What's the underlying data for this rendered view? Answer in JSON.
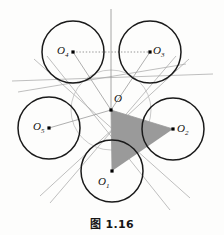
{
  "figure": {
    "caption": "图 1.16",
    "center_label": "O",
    "colors": {
      "circle_stroke": "#1a1a1a",
      "thin_line": "#9b9b9b",
      "inner_circle": "#b4b4b4",
      "triangle_fill": "#9a9a9a",
      "dot": "#000000",
      "background": "#fdfdfc",
      "text": "#111111"
    },
    "center": {
      "name": "O",
      "x": 111,
      "y": 110
    },
    "inner_circle": {
      "cx": 111,
      "cy": 110,
      "r": 40
    },
    "circles": [
      {
        "name": "O1",
        "label": "O",
        "sub": "1",
        "cx": 112,
        "cy": 171,
        "r": 31,
        "label_x": 102,
        "label_y": 178
      },
      {
        "name": "O2",
        "label": "O",
        "sub": "2",
        "cx": 173,
        "cy": 129,
        "r": 31,
        "label_x": 180,
        "label_y": 124
      },
      {
        "name": "O3",
        "label": "O",
        "sub": "3",
        "cx": 150,
        "cy": 52,
        "r": 31,
        "label_x": 155,
        "label_y": 47
      },
      {
        "name": "O4",
        "label": "O",
        "sub": "4",
        "cx": 73,
        "cy": 52,
        "r": 31,
        "label_x": 55,
        "label_y": 47
      },
      {
        "name": "O5",
        "label": "O",
        "sub": "5",
        "cx": 49,
        "cy": 128,
        "r": 31,
        "label_x": 32,
        "label_y": 124
      }
    ],
    "triangle": {
      "name": "shaded-triangle",
      "vertices": "O, O2, O1",
      "points": "111,110 173,129 112,171"
    },
    "radii_segments": [
      {
        "from": "O",
        "to": "O1"
      },
      {
        "from": "O",
        "to": "O2"
      },
      {
        "from": "O",
        "to": "O3"
      },
      {
        "from": "O",
        "to": "O4"
      },
      {
        "from": "O",
        "to": "O5"
      }
    ],
    "dotted_line": {
      "from": "O4",
      "to": "O3"
    },
    "vertical_axis": {
      "x": 111,
      "y_top": 10,
      "y_bottom": 110
    },
    "tangent_lines": [
      {
        "x1": 9,
        "y1": 80,
        "x2": 214,
        "y2": 75
      },
      {
        "x1": 31,
        "y1": 62,
        "x2": 194,
        "y2": 196
      },
      {
        "x1": 191,
        "y1": 62,
        "x2": 44,
        "y2": 196
      },
      {
        "x1": 9,
        "y1": 85,
        "x2": 180,
        "y2": 82
      },
      {
        "x1": 44,
        "y1": 58,
        "x2": 173,
        "y2": 208
      },
      {
        "x1": 178,
        "y1": 58,
        "x2": 52,
        "y2": 200
      }
    ]
  }
}
